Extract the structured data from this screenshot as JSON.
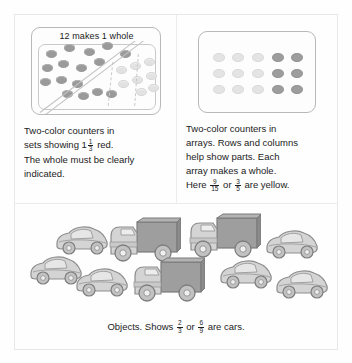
{
  "figure": {
    "cells": {
      "sets": {
        "model_label": "12 makes 1 whole",
        "caption_lines": [
          "Two-color counters in",
          "sets showing",
          "red.",
          "The whole must be clearly",
          "indicated."
        ],
        "mixed_number": {
          "whole": "1",
          "numerator": "1",
          "denominator": "3"
        },
        "counters": {
          "red_count": 16,
          "yellow_count": 8,
          "red_positions": [
            [
              14,
              22
            ],
            [
              32,
              16
            ],
            [
              52,
              20
            ],
            [
              70,
              14
            ],
            [
              88,
              22
            ],
            [
              10,
              36
            ],
            [
              26,
              32
            ],
            [
              44,
              36
            ],
            [
              62,
              30
            ],
            [
              8,
              50
            ],
            [
              24,
              48
            ],
            [
              40,
              52
            ],
            [
              30,
              62
            ],
            [
              46,
              64
            ],
            [
              60,
              60
            ],
            [
              74,
              62
            ]
          ],
          "yellow_positions": [
            [
              84,
              38
            ],
            [
              98,
              34
            ],
            [
              112,
              30
            ],
            [
              86,
              52
            ],
            [
              100,
              48
            ],
            [
              114,
              44
            ],
            [
              104,
              60
            ],
            [
              116,
              56
            ]
          ]
        }
      },
      "arrays": {
        "caption_lines": [
          "Two-color counters in",
          "arrays. Rows and columns",
          "help show parts. Each",
          "array makes a whole.",
          "Here",
          "or",
          "are yellow."
        ],
        "fraction_1": {
          "numerator": "9",
          "denominator": "15"
        },
        "fraction_2": {
          "numerator": "3",
          "denominator": "5"
        },
        "grid": {
          "rows": 3,
          "columns": 5,
          "cells": [
            [
              "yellow",
              "yellow",
              "yellow",
              "red",
              "red"
            ],
            [
              "yellow",
              "yellow",
              "yellow",
              "red",
              "red"
            ],
            [
              "yellow",
              "yellow",
              "yellow",
              "red",
              "red"
            ]
          ]
        }
      },
      "objects": {
        "caption_prefix": "Objects. Shows",
        "caption_conjunction": "or",
        "caption_suffix": "are cars.",
        "fraction_1": {
          "numerator": "2",
          "denominator": "3"
        },
        "fraction_2": {
          "numerator": "6",
          "denominator": "9"
        },
        "items": [
          {
            "kind": "car",
            "x": 38,
            "y": 18
          },
          {
            "kind": "truck",
            "x": 88,
            "y": 12
          },
          {
            "kind": "truck",
            "x": 168,
            "y": 8
          },
          {
            "kind": "car",
            "x": 248,
            "y": 22
          },
          {
            "kind": "car",
            "x": 12,
            "y": 48
          },
          {
            "kind": "car",
            "x": 58,
            "y": 60
          },
          {
            "kind": "truck",
            "x": 112,
            "y": 52
          },
          {
            "kind": "car",
            "x": 202,
            "y": 52
          },
          {
            "kind": "car",
            "x": 258,
            "y": 62
          }
        ],
        "counts": {
          "cars": 6,
          "trucks": 3,
          "total": 9
        }
      }
    },
    "colors": {
      "red_counter": "#9a9a9a",
      "yellow_counter": "#e2e2e2",
      "border": "#b9b9b9",
      "text": "#1c1c1c",
      "vehicle_body": "#d4d4d4",
      "truck_box": "#9e9e9e"
    }
  }
}
